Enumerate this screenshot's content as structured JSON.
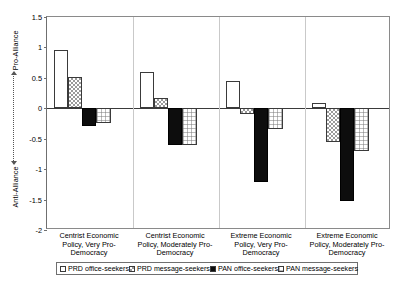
{
  "chart_data": {
    "type": "bar",
    "title": "",
    "xlabel": "",
    "ylabel": "Anti-Alliance <---------> Pro-Alliance",
    "ylabel_parts": {
      "bottom": "Anti-Alliance",
      "top": "Pro-Alliance"
    },
    "ylim": [
      -2,
      1.5
    ],
    "yticks": [
      1.5,
      1,
      0.5,
      0,
      -0.5,
      -1,
      -1.5,
      -2
    ],
    "ytick_labels": [
      "1.5",
      "1",
      "0.5",
      "0",
      "-0.5",
      "-1",
      "-1.5",
      "-2"
    ],
    "grid": false,
    "legend_position": "bottom",
    "categories": [
      "Centrist Economic Policy, Very Pro-Democracy",
      "Centrist Economic Policy, Moderately Pro-Democracy",
      "Extreme Economic Policy, Very Pro-Democracy",
      "Extreme Economic Policy, Moderately Pro-Democracy"
    ],
    "category_lines": [
      [
        "Centrist Economic",
        "Policy, Very Pro-",
        "Democracy"
      ],
      [
        "Centrist Economic",
        "Policy, Moderately Pro-",
        "Democracy"
      ],
      [
        "Extreme Economic",
        "Policy, Very Pro-",
        "Democracy"
      ],
      [
        "Extreme Economic",
        "Policy, Moderately Pro-",
        "Democracy"
      ]
    ],
    "series": [
      {
        "name": "PRD office-seekers",
        "pattern": "white",
        "values": [
          0.95,
          0.59,
          0.45,
          0.09
        ]
      },
      {
        "name": "PRD message-seekers",
        "pattern": "checkered",
        "values": [
          0.52,
          0.17,
          -0.1,
          -0.55
        ]
      },
      {
        "name": "PAN office-seekers",
        "pattern": "black",
        "values": [
          -0.29,
          -0.6,
          -1.21,
          -1.52
        ]
      },
      {
        "name": "PAN message-seekers",
        "pattern": "grid",
        "values": [
          -0.24,
          -0.61,
          -0.34,
          -0.7
        ]
      }
    ]
  },
  "legend": {
    "items": [
      "PRD office-seekers",
      "PRD message-seekers",
      "PAN office-seekers",
      "PAN message-seekers"
    ]
  }
}
